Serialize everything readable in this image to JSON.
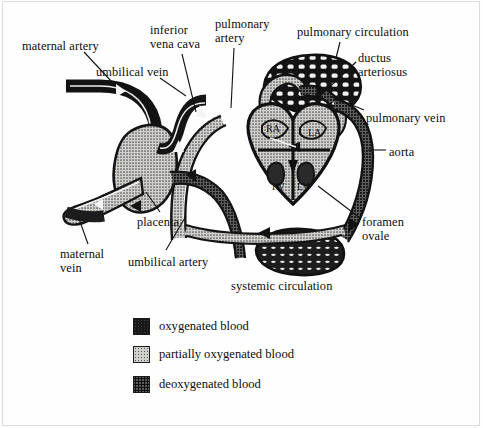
{
  "figure": {
    "colors": {
      "oxygenated": "#181818",
      "partially_oxygenated": "#d2d0cd",
      "deoxygenated": "#5a5a5a",
      "outline": "#111111",
      "background": "#fefefe"
    }
  },
  "labels": [
    {
      "key": "maternal-artery",
      "text": "maternal artery",
      "x": 22,
      "y": 40
    },
    {
      "key": "inferior-vena-cava",
      "text": "inferior\nvena cava",
      "x": 150,
      "y": 24
    },
    {
      "key": "pulmonary-artery",
      "text": "pulmonary\nartery",
      "x": 215,
      "y": 18
    },
    {
      "key": "pulmonary-circulation",
      "text": "pulmonary circulation",
      "x": 297,
      "y": 26
    },
    {
      "key": "umbilical-vein",
      "text": "umbilical vein",
      "x": 96,
      "y": 66
    },
    {
      "key": "ductus-arteriosus",
      "text": "ductus\narteriosus",
      "x": 358,
      "y": 52
    },
    {
      "key": "pulmonary-vein",
      "text": "pulmonary vein",
      "x": 366,
      "y": 112
    },
    {
      "key": "aorta",
      "text": "aorta",
      "x": 389,
      "y": 146
    },
    {
      "key": "placenta",
      "text": "placenta",
      "x": 137,
      "y": 216
    },
    {
      "key": "foramen-ovale",
      "text": "foramen\novale",
      "x": 362,
      "y": 216
    },
    {
      "key": "maternal-vein",
      "text": "maternal\nvein",
      "x": 60,
      "y": 248
    },
    {
      "key": "umbilical-artery",
      "text": "umbilical artery",
      "x": 128,
      "y": 256
    },
    {
      "key": "systemic-circulation",
      "text": "systemic circulation",
      "x": 231,
      "y": 280
    }
  ],
  "heart_chambers": [
    {
      "key": "right-atrium",
      "text": "RA",
      "x": 270,
      "y": 129
    },
    {
      "key": "left-atrium",
      "text": "LA",
      "x": 312,
      "y": 133
    },
    {
      "key": "right-ventricle",
      "text": "RV",
      "x": 277,
      "y": 185
    },
    {
      "key": "left-ventricle",
      "text": "LV",
      "x": 300,
      "y": 185
    }
  ],
  "legend": {
    "items": [
      {
        "key": "oxygenated",
        "label": "oxygenated blood",
        "swatch": "sw-oxy"
      },
      {
        "key": "partially-oxygenated",
        "label": "partially oxygenated blood",
        "swatch": "sw-partial"
      },
      {
        "key": "deoxygenated",
        "label": "deoxygenated blood",
        "swatch": "sw-deoxy"
      }
    ]
  }
}
